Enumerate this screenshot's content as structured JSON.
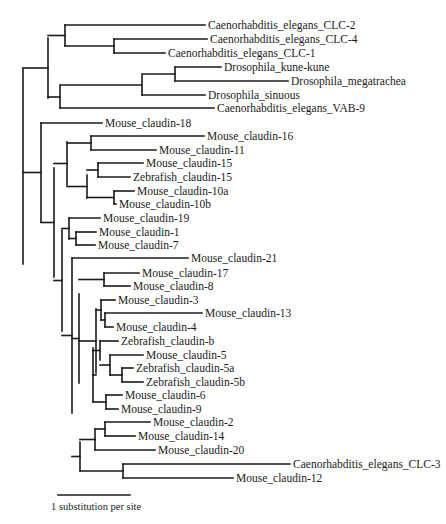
{
  "figure": {
    "scale_bar": {
      "label": "1 substitution per site",
      "x1": 58,
      "x2": 130,
      "y": 495,
      "label_y": 510
    }
  },
  "leaves": [
    {
      "id": "CLC-2",
      "label": "Caenorhabditis_elegans_CLC-2",
      "y": 25,
      "x": 205
    },
    {
      "id": "CLC-4",
      "label": "Caenorhabditis_elegans_CLC-4",
      "y": 39,
      "x": 207
    },
    {
      "id": "CLC-1",
      "label": "Caenorhabditis_elegans_CLC-1",
      "y": 53,
      "x": 165
    },
    {
      "id": "kune",
      "label": "Drosophila_kune-kune",
      "y": 67,
      "x": 221
    },
    {
      "id": "mega",
      "label": "Drosophila_megatrachea",
      "y": 81,
      "x": 288
    },
    {
      "id": "sin",
      "label": "Drosophila_sinuous",
      "y": 95,
      "x": 205
    },
    {
      "id": "VAB9",
      "label": "Caenorhabditis_elegans_VAB-9",
      "y": 108,
      "x": 214
    },
    {
      "id": "c18",
      "label": "Mouse_claudin-18",
      "y": 123,
      "x": 102
    },
    {
      "id": "c16",
      "label": "Mouse_claudin-16",
      "y": 136,
      "x": 204
    },
    {
      "id": "c11",
      "label": "Mouse_claudin-11",
      "y": 150,
      "x": 156
    },
    {
      "id": "c15",
      "label": "Mouse_claudin-15",
      "y": 163,
      "x": 143
    },
    {
      "id": "z15",
      "label": "Zebrafish_claudin-15",
      "y": 177,
      "x": 130
    },
    {
      "id": "c10a",
      "label": "Mouse_claudin-10a",
      "y": 191,
      "x": 134
    },
    {
      "id": "c10b",
      "label": "Mouse_claudin-10b",
      "y": 204,
      "x": 116
    },
    {
      "id": "c19",
      "label": "Mouse_claudin-19",
      "y": 218,
      "x": 100
    },
    {
      "id": "c1",
      "label": "Mouse_claudin-1",
      "y": 232,
      "x": 96
    },
    {
      "id": "c7",
      "label": "Mouse_claudin-7",
      "y": 245,
      "x": 95
    },
    {
      "id": "c21",
      "label": "Mouse_claudin-21",
      "y": 258,
      "x": 188
    },
    {
      "id": "c17",
      "label": "Mouse_claudin-17",
      "y": 273,
      "x": 139
    },
    {
      "id": "c8",
      "label": "Mouse_claudin-8",
      "y": 286,
      "x": 130
    },
    {
      "id": "c3",
      "label": "Mouse_claudin-3",
      "y": 300,
      "x": 115
    },
    {
      "id": "c13",
      "label": "Mouse_claudin-13",
      "y": 313,
      "x": 202
    },
    {
      "id": "c4",
      "label": "Mouse_claudin-4",
      "y": 327,
      "x": 113
    },
    {
      "id": "zb",
      "label": "Zebrafish_claudin-b",
      "y": 341,
      "x": 118
    },
    {
      "id": "c5",
      "label": "Mouse_claudin-5",
      "y": 355,
      "x": 143
    },
    {
      "id": "z5a",
      "label": "Zebrafish_claudin-5a",
      "y": 368,
      "x": 133
    },
    {
      "id": "z5b",
      "label": "Zebrafish_claudin-5b",
      "y": 382,
      "x": 143
    },
    {
      "id": "c6",
      "label": "Mouse_claudin-6",
      "y": 395,
      "x": 122
    },
    {
      "id": "c9",
      "label": "Mouse_claudin-9",
      "y": 409,
      "x": 118
    },
    {
      "id": "c2",
      "label": "Mouse_claudin-2",
      "y": 422,
      "x": 150
    },
    {
      "id": "c14",
      "label": "Mouse_claudin-14",
      "y": 436,
      "x": 135
    },
    {
      "id": "c20",
      "label": "Mouse_claudin-20",
      "y": 450,
      "x": 155
    },
    {
      "id": "CLC-3",
      "label": "Caenorhabditis_elegans_CLC-3",
      "y": 464,
      "x": 290
    },
    {
      "id": "c12",
      "label": "Mouse_claudin-12",
      "y": 478,
      "x": 233
    }
  ],
  "nodes": [
    {
      "x": 23,
      "y1": 69,
      "y2": 264,
      "px": null
    },
    {
      "x": 48,
      "y1": 38,
      "y2": 98,
      "px": 23
    },
    {
      "x": 65,
      "y1": 25,
      "y2": 46,
      "px": 48
    },
    {
      "x": 114,
      "y1": 39,
      "y2": 53,
      "px": 65
    },
    {
      "x": 60,
      "y1": 86,
      "y2": 108,
      "px": 48
    },
    {
      "x": 142,
      "y1": 75,
      "y2": 95,
      "px": 60
    },
    {
      "x": 175,
      "y1": 67,
      "y2": 81,
      "px": 142
    },
    {
      "x": 41,
      "y1": 123,
      "y2": 222,
      "px": 23
    },
    {
      "x": 54,
      "y1": 168,
      "y2": 277,
      "px": 41
    },
    {
      "x": 67,
      "y1": 142,
      "y2": 185,
      "px": 54
    },
    {
      "x": 91,
      "y1": 136,
      "y2": 150,
      "px": 67
    },
    {
      "x": 87,
      "y1": 175,
      "y2": 198,
      "px": 67
    },
    {
      "x": 98,
      "y1": 163,
      "y2": 177,
      "px": 87
    },
    {
      "x": 114,
      "y1": 191,
      "y2": 204,
      "px": 87
    },
    {
      "x": 62,
      "y1": 230,
      "y2": 331,
      "px": 54
    },
    {
      "x": 69,
      "y1": 218,
      "y2": 239,
      "px": 62
    },
    {
      "x": 76,
      "y1": 232,
      "y2": 245,
      "px": 69
    },
    {
      "x": 72,
      "y1": 258,
      "y2": 413,
      "px": 62
    },
    {
      "x": 79,
      "y1": 294,
      "y2": 383,
      "px": 72
    },
    {
      "x": 104,
      "y1": 273,
      "y2": 286,
      "px": 79
    },
    {
      "x": 96,
      "y1": 309,
      "y2": 373,
      "px": 79
    },
    {
      "x": 101,
      "y1": 300,
      "y2": 320,
      "px": 96
    },
    {
      "x": 105,
      "y1": 313,
      "y2": 327,
      "px": 101
    },
    {
      "x": 93,
      "y1": 348,
      "y2": 402,
      "px": 96
    },
    {
      "x": 100,
      "y1": 341,
      "y2": 360,
      "px": 93
    },
    {
      "x": 110,
      "y1": 355,
      "y2": 375,
      "px": 100
    },
    {
      "x": 122,
      "y1": 368,
      "y2": 382,
      "px": 110
    },
    {
      "x": 106,
      "y1": 395,
      "y2": 409,
      "px": 93
    },
    {
      "x": 80,
      "y1": 442,
      "y2": 471,
      "px": 72
    },
    {
      "x": 95,
      "y1": 429,
      "y2": 450,
      "px": 80
    },
    {
      "x": 105,
      "y1": 422,
      "y2": 436,
      "px": 95
    },
    {
      "x": 123,
      "y1": 464,
      "y2": 478,
      "px": 80
    }
  ],
  "leaf_parents": {
    "CLC-2": 65,
    "CLC-4": 114,
    "CLC-1": 114,
    "kune": 175,
    "mega": 175,
    "sin": 142,
    "VAB9": 60,
    "c18": 41,
    "c16": 91,
    "c11": 91,
    "c15": 98,
    "z15": 98,
    "c10a": 114,
    "c10b": 114,
    "c19": 69,
    "c1": 76,
    "c7": 76,
    "c21": 72,
    "c17": 104,
    "c8": 104,
    "c3": 101,
    "c13": 105,
    "c4": 105,
    "zb": 100,
    "c5": 110,
    "z5a": 122,
    "z5b": 122,
    "c6": 106,
    "c9": 106,
    "c2": 105,
    "c14": 105,
    "c20": 95,
    "CLC-3": 123,
    "c12": 123
  }
}
